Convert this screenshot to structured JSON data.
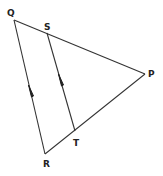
{
  "diagram": {
    "points": {
      "Q": {
        "label": "Q",
        "x": 14,
        "y": 18
      },
      "S": {
        "label": "S",
        "x": 47,
        "y": 27
      },
      "P": {
        "label": "P",
        "x": 146,
        "y": 73
      },
      "R": {
        "label": "R",
        "x": 45,
        "y": 159
      },
      "T": {
        "label": "T",
        "x": 74,
        "y": 139
      }
    },
    "segments": [
      {
        "from": "Q",
        "to": "P"
      },
      {
        "from": "P",
        "to": "R"
      },
      {
        "from": "Q",
        "to": "R"
      },
      {
        "from": "S",
        "to": "T"
      }
    ],
    "parallel_marks": [
      {
        "segment": "QR",
        "style": "single-arrow"
      },
      {
        "segment": "ST",
        "style": "single-arrow"
      }
    ],
    "line_color": "#333333"
  }
}
